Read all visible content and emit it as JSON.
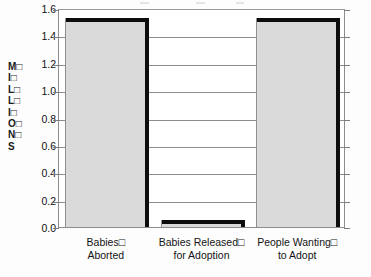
{
  "chart_data": {
    "type": "bar",
    "title": "",
    "subtitle": "",
    "xlabel": "",
    "ylabel": "M□ I□ L□ L□ I□ O□ N□ S",
    "ylabel_lines": [
      "M□",
      "I□",
      "L□",
      "L□",
      "I□",
      "O□",
      "N□",
      "S"
    ],
    "categories": [
      "Babies□ Aborted",
      "Babies Released□ for Adoption",
      "People Wanting□ to Adopt"
    ],
    "category_lines": [
      [
        "Babies□",
        "Aborted"
      ],
      [
        "Babies Released□",
        "for Adoption"
      ],
      [
        "People Wanting□",
        "to Adopt"
      ]
    ],
    "values": [
      1.53,
      0.05,
      1.53
    ],
    "ylim": [
      0.0,
      1.6
    ],
    "ytick_values": [
      0.0,
      0.2,
      0.4,
      0.6,
      0.8,
      1.0,
      1.2,
      1.4,
      1.6
    ],
    "ytick_labels": [
      "0.0",
      "0.2",
      "0.4",
      "0.6",
      "0.8",
      "1.0",
      "1.2",
      "1.4",
      "1.6"
    ],
    "grid": true,
    "grid_axis": "y",
    "legend": false,
    "legend_position": "none",
    "bar_fill_color": "#dadada",
    "bar_edge_color": "#0d0d0d",
    "grid_color": "#8d8d8d",
    "axis_color": "#8d8d8d",
    "text_color": "#141414",
    "background_color": "#ffffff"
  }
}
